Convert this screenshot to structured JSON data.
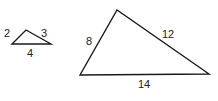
{
  "figure": {
    "small_triangle": {
      "sides": {
        "left": "2",
        "right": "3",
        "bottom": "4"
      },
      "vertices": [
        [
          12,
          44
        ],
        [
          26,
          30
        ],
        [
          51,
          44
        ]
      ]
    },
    "large_triangle": {
      "sides": {
        "left": "8",
        "right": "12",
        "bottom": "14"
      },
      "vertices": [
        [
          80,
          75
        ],
        [
          117,
          10
        ],
        [
          209,
          74
        ]
      ]
    },
    "stroke_color": "#1a1a1a"
  }
}
